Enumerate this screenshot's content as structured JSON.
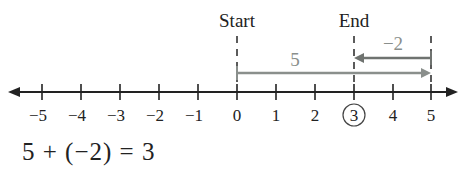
{
  "diagram": {
    "type": "number-line",
    "start_label": "Start",
    "end_label": "End",
    "ticks": [
      "−5",
      "−4",
      "−3",
      "−2",
      "−1",
      "0",
      "1",
      "2",
      "3",
      "4",
      "5"
    ],
    "circled_tick": "3",
    "arrow_forward": {
      "label": "5",
      "from": 0,
      "to": 5,
      "color": "#8a8f8c"
    },
    "arrow_back": {
      "label": "−2",
      "from": 5,
      "to": 3,
      "color": "#6f7370"
    },
    "equation": "5 + (−2) = 3",
    "colors": {
      "axis": "#222222",
      "arrow_forward": "#8a8f8c",
      "arrow_back": "#6f7370",
      "dash": "#333333"
    }
  }
}
